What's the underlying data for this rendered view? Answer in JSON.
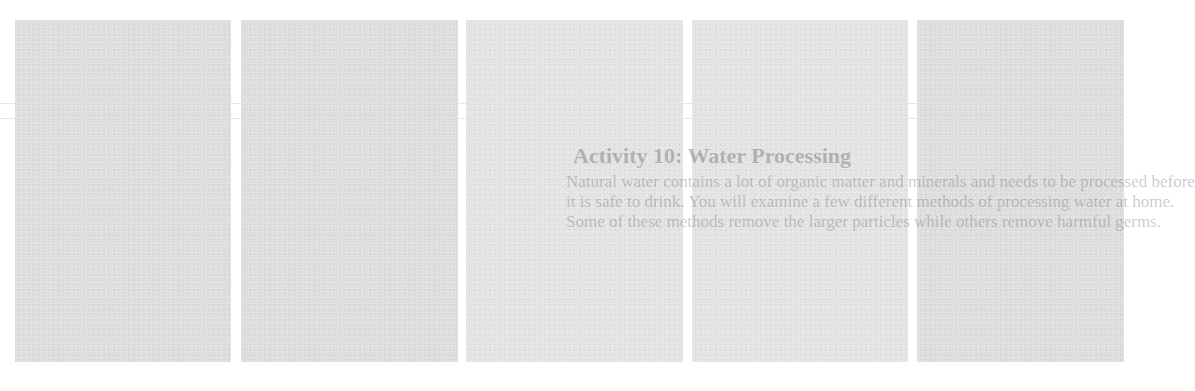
{
  "page": {
    "background": "#ffffff",
    "panel_color": "#dedede"
  },
  "panels": [
    {
      "id": 1,
      "x": 15,
      "width": 216
    },
    {
      "id": 2,
      "x": 241,
      "width": 217
    },
    {
      "id": 3,
      "x": 466,
      "width": 217
    },
    {
      "id": 4,
      "x": 692,
      "width": 216
    },
    {
      "id": 5,
      "x": 917,
      "width": 207
    }
  ],
  "ghost_text": {
    "title": "Activity 10: Water Processing",
    "lines": [
      "Natural water contains a lot of organic matter and minerals and needs to be processed before",
      "it is safe to drink. You will examine a few different methods of processing water at home.",
      "Some of these methods remove the larger particles while others remove harmful germs."
    ]
  }
}
